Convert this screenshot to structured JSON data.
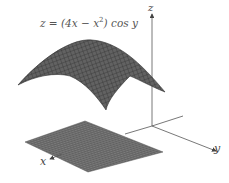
{
  "figure": {
    "equation": {
      "lhs": "z = (4x − x",
      "exp": "2",
      "rhs": ") cos y"
    },
    "axes": {
      "z_label": "z",
      "y_label": "y",
      "x_label": "x"
    },
    "colors": {
      "surface": "#5a5a5a",
      "mesh": "#2e2e2e",
      "plane": "#6a6a6a",
      "axis": "#555555"
    },
    "surface_description": "Dome-shaped surface of z=(4x−x^2)cos y above a rectangular domain in the xy-plane"
  }
}
